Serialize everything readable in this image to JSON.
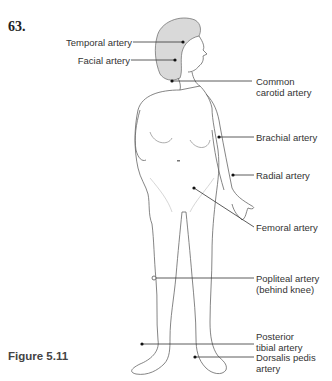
{
  "question_number": "63.",
  "figure_caption": "Figure 5.11",
  "labels": {
    "temporal": "Temporal artery",
    "facial": "Facial artery",
    "carotid_line1": "Common",
    "carotid_line2": "carotid artery",
    "brachial": "Brachial artery",
    "radial": "Radial artery",
    "femoral": "Femoral artery",
    "popliteal_line1": "Popliteal artery",
    "popliteal_line2": "(behind knee)",
    "posterior_line1": "Posterior",
    "posterior_line2": "tibial artery",
    "dorsalis_line1": "Dorsalis pedis",
    "dorsalis_line2": "artery"
  },
  "colors": {
    "hair": "#d9d9d9",
    "outline": "#555555",
    "leader": "#333333",
    "dot": "#111111"
  }
}
